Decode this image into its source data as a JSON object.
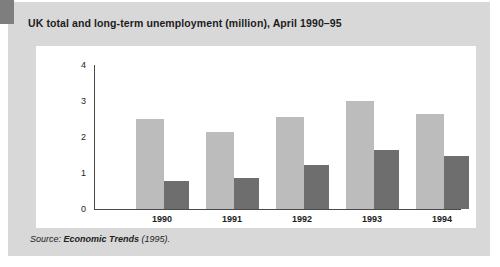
{
  "figure": {
    "title": "UK total and long-term unemployment (million), April 1990–95",
    "source_prefix": "Source:",
    "source_work": "Economic Trends",
    "source_suffix": "(1995).",
    "colors": {
      "panel_background": "#d8d8d8",
      "plot_background": "#ffffff",
      "corner_tab": "#7e7e7e",
      "axis": "#4a4a4a",
      "total_bar": "#bcbcbc",
      "longterm_bar": "#6e6e6e",
      "title_text": "#1d1d1d"
    }
  },
  "chart_data": {
    "type": "bar",
    "title": "UK total and long-term unemployment (million), April 1990–95",
    "xlabel": "",
    "ylabel": "",
    "ylim": [
      0,
      4
    ],
    "yticks": [
      0,
      1,
      2,
      3,
      4
    ],
    "ytick_labels": [
      "0",
      "1",
      "2",
      "3",
      "4"
    ],
    "grid": false,
    "legend": "none",
    "categories": [
      "1990",
      "1991",
      "1992",
      "1993",
      "1994"
    ],
    "series": [
      {
        "name": "Total unemployment",
        "color": "#bcbcbc",
        "values": [
          2.5,
          2.15,
          2.55,
          3.0,
          2.65
        ]
      },
      {
        "name": "Long-term unemployment",
        "color": "#6e6e6e",
        "values": [
          0.78,
          0.85,
          1.22,
          1.65,
          1.48
        ]
      }
    ]
  }
}
